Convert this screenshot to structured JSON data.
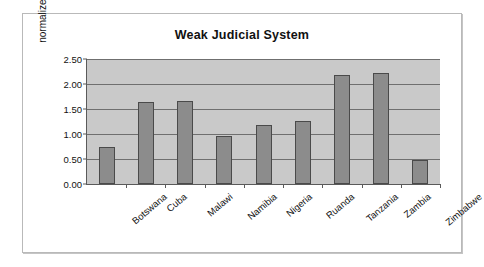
{
  "chart_data": {
    "type": "bar",
    "title": "Weak Judicial System",
    "xlabel": "",
    "ylabel": "normalized index",
    "ylim": [
      0.0,
      2.5
    ],
    "ytick_labels": [
      "0.00",
      "0.50",
      "1.00",
      "1.50",
      "2.00",
      "2.50"
    ],
    "ytick_values": [
      0.0,
      0.5,
      1.0,
      1.5,
      2.0,
      2.5
    ],
    "grid": true,
    "legend": false,
    "categories": [
      "Botswana",
      "Cuba",
      "Malawi",
      "Namibia",
      "Nigeria",
      "Ruanda",
      "Tanzania",
      "Zambia",
      "Zimbabwe"
    ],
    "values": [
      0.75,
      1.64,
      1.66,
      0.96,
      1.18,
      1.27,
      2.18,
      2.23,
      0.48
    ],
    "colors": {
      "bar_fill": "#8c8c8c",
      "bar_border": "#4a4a4a",
      "plot_background": "#c9c9c9",
      "gridline": "#6f6f6f",
      "axis": "#5a5a5a",
      "frame_border": "#b9b9b9",
      "page_background": "#ffffff",
      "text": "#111111"
    }
  }
}
